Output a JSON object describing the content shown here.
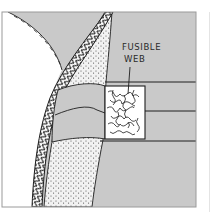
{
  "diagram": {
    "labels": [
      {
        "id": "fusible-web-label",
        "lines": [
          "FUSIBLE",
          "WEB"
        ]
      }
    ],
    "colors": {
      "background": "#ffffff",
      "fabric_fill": "#c9c9c9",
      "stipple_fill": "#f2f2f2",
      "stipple_dots": "#4a4a4a",
      "line": "#1e1e1e",
      "web_fill": "#ffffff"
    }
  }
}
